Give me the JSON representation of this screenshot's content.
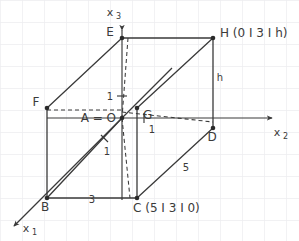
{
  "figure": {
    "title_alt": "3D coordinate system with cuboid ABCD EFGH",
    "background_color": "#ffffff",
    "grid_color": "#ededf0",
    "line_color": "#3a3a3a",
    "grid_spacing_px": 22
  },
  "axes": [
    {
      "name": "x1-axis",
      "label": "x",
      "subscript": "1",
      "direction": "down-left"
    },
    {
      "name": "x2-axis",
      "label": "x",
      "subscript": "2",
      "direction": "right"
    },
    {
      "name": "x3-axis",
      "label": "x",
      "subscript": "3",
      "direction": "up"
    }
  ],
  "vertices": [
    {
      "id": "E",
      "label": "E",
      "x": 122,
      "y": 38
    },
    {
      "id": "H",
      "label": "H",
      "x": 213,
      "y": 38
    },
    {
      "id": "F",
      "label": "F",
      "x": 47,
      "y": 108
    },
    {
      "id": "G",
      "label": "G",
      "x": 137,
      "y": 108
    },
    {
      "id": "A",
      "label": "A = O",
      "x": 122,
      "y": 118
    },
    {
      "id": "D",
      "label": "D",
      "x": 213,
      "y": 128
    },
    {
      "id": "B",
      "label": "B",
      "x": 47,
      "y": 198
    },
    {
      "id": "C",
      "label": "C",
      "x": 137,
      "y": 198
    }
  ],
  "coordinate_labels": [
    {
      "id": "H",
      "text": "H (0 I 3 I h)"
    },
    {
      "id": "C",
      "text": "C (5 I 3 I 0)"
    }
  ],
  "origin_label": "A = O",
  "measurements": [
    {
      "id": "unit-x3",
      "text": "1"
    },
    {
      "id": "unit-x2",
      "text": "1"
    },
    {
      "id": "unit-x1",
      "text": "1"
    },
    {
      "id": "edge-bc",
      "text": "3"
    },
    {
      "id": "edge-cd",
      "text": "5"
    },
    {
      "id": "edge-hd",
      "text": "h"
    }
  ]
}
